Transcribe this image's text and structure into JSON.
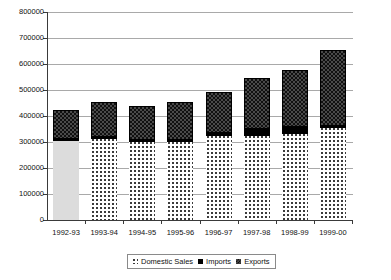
{
  "chart_data": {
    "type": "bar",
    "subtype": "stacked-column",
    "title": "",
    "xlabel": "",
    "ylabel": "",
    "ylim": [
      0,
      800000
    ],
    "ytick_values": [
      0,
      100000,
      200000,
      300000,
      400000,
      500000,
      600000,
      700000,
      800000
    ],
    "ytick_labels": [
      "0",
      "100000",
      "200000",
      "300000",
      "400000",
      "500000",
      "600000",
      "700000",
      "800000"
    ],
    "grid": true,
    "legend_position": "bottom",
    "categories": [
      "1992-93",
      "1993-94",
      "1994-95",
      "1995-96",
      "1996-97",
      "1997-98",
      "1998-99",
      "1999-00"
    ],
    "series": [
      {
        "name": "Domestic Sales",
        "pattern": "dotted",
        "color": "#dcdcdc",
        "values": [
          304000,
          311000,
          300000,
          300000,
          323000,
          323000,
          331000,
          354000
        ]
      },
      {
        "name": "Imports",
        "pattern": "solid-black",
        "color": "#000000",
        "values": [
          8000,
          8000,
          8000,
          8000,
          12000,
          27000,
          27000,
          8000
        ]
      },
      {
        "name": "Exports",
        "pattern": "checkerboard",
        "color": "#4a4a4a",
        "values": [
          111000,
          135000,
          130000,
          146000,
          157000,
          196000,
          219000,
          292000
        ]
      }
    ],
    "totals": [
      423000,
      454000,
      438000,
      454000,
      492000,
      546000,
      577000,
      654000
    ]
  },
  "legend": {
    "items": [
      {
        "label": "Domestic Sales",
        "swatch": "domestic-sales-swatch"
      },
      {
        "label": "Imports",
        "swatch": "imports-swatch"
      },
      {
        "label": "Exports",
        "swatch": "exports-swatch"
      }
    ]
  }
}
